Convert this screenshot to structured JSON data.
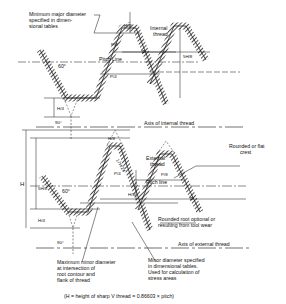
{
  "diagram": {
    "internal": {
      "label": "Internal thread",
      "label_line1": "Internal",
      "label_line2": "thread",
      "min_major_note_lines": [
        "Minimum major diameter",
        "specified in dimen-",
        "sional tables"
      ],
      "angle": "60°",
      "pitch_line": "Pitch Line",
      "p_label": "P",
      "p_over_8": "P/8",
      "p_over_4": "P/4",
      "h_8": "H/8",
      "h_4": "H/4",
      "five_h_8": "5H/8",
      "right_angle": "90°",
      "axis_label": "Axis of internal thread"
    },
    "external": {
      "label_line1": "External",
      "label_line2": "thread",
      "crest_note_lines": [
        "Rounded or flat",
        "crest"
      ],
      "angle": "60°",
      "pitch_line": "Pitch line",
      "p_label": "P",
      "p_over_8": "P/8",
      "p_over_4": "P/4",
      "h_label": "H",
      "h_8": "H/8",
      "h_4": "H/4",
      "h_8_rot": "H/8",
      "five_h_8": "5H/8",
      "seventeen_h_24": "17H/24",
      "root_note_lines": [
        "Rounded root optional or",
        "resulting from tool wear"
      ],
      "right_angle": "90°",
      "axis_label": "Axis of external thread",
      "max_minor_note_lines": [
        "Maximum minor diameter",
        "at intersection of",
        "root contour and",
        "flank of thread"
      ],
      "minor_note_lines": [
        "Minor diameter specified",
        "in dimensional tables.",
        "Used for calculation of",
        "stress areas"
      ]
    },
    "footer": "(H = height of sharp V thread = 0.86603 × pitch)"
  }
}
